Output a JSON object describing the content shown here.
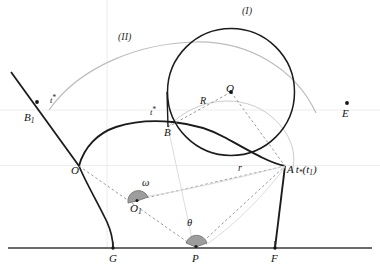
{
  "figure": {
    "type": "geometry-diagram"
  },
  "colors": {
    "stroke_dark": "#1b1b1b",
    "stroke_gray": "#8e8e8e",
    "stroke_light": "#c9c9c9",
    "guide_line": "#e6e6e6",
    "angle_fill": "#9d9d9d",
    "baseline": "#3a3a3a",
    "label": "#141414"
  },
  "curve_labels": [
    {
      "name": "curve-label-one",
      "text": "(I)",
      "x": 244,
      "y": 8
    },
    {
      "name": "curve-label-two",
      "text": "(II)",
      "x": 120,
      "y": 34
    }
  ],
  "points": [
    {
      "name": "point-B1",
      "label": "B",
      "sub": "1",
      "x": 20,
      "y": 112
    },
    {
      "name": "point-O",
      "label": "O",
      "sub": "",
      "x": 79,
      "y": 166
    },
    {
      "name": "point-B",
      "label": "B",
      "sub": "",
      "x": 168,
      "y": 127
    },
    {
      "name": "point-A",
      "label": "A",
      "sub": "",
      "x": 285,
      "y": 166
    },
    {
      "name": "point-Q",
      "label": "Q",
      "sub": "",
      "x": 231,
      "y": 92
    },
    {
      "name": "point-E",
      "label": "E",
      "sub": "",
      "x": 344,
      "y": 112
    },
    {
      "name": "point-O1",
      "label": "O",
      "sub": "1",
      "x": 137,
      "y": 200
    },
    {
      "name": "point-G",
      "label": "G",
      "sub": "",
      "x": 113,
      "y": 255
    },
    {
      "name": "point-P",
      "label": "P",
      "sub": "",
      "x": 196,
      "y": 255
    },
    {
      "name": "point-F",
      "label": "F",
      "sub": "",
      "x": 275,
      "y": 255
    }
  ],
  "tangent_labels": [
    {
      "name": "tangent-label-B1",
      "text": "t",
      "star": "*",
      "x": 46,
      "y": 99
    },
    {
      "name": "tangent-label-B",
      "text": "t",
      "star": "*",
      "x": 152,
      "y": 112
    }
  ],
  "segment_labels": [
    {
      "name": "radius-label-R",
      "text": "R",
      "x": 203,
      "y": 101
    },
    {
      "name": "radius-label-r",
      "text": "r",
      "x": 240,
      "y": 168
    }
  ],
  "angle_labels": [
    {
      "name": "angle-label-omega",
      "text": "ω",
      "x": 145,
      "y": 183
    },
    {
      "name": "angle-label-theta",
      "text": "θ",
      "x": 190,
      "y": 223
    }
  ],
  "point_A_annotation": {
    "name": "point-A-parameter-label",
    "main": "A",
    "param": "t",
    "param_sub": "*",
    "paren_open": "(",
    "arg": "t",
    "arg_sub": "1",
    "paren_close": ")",
    "x": 285,
    "y": 166
  },
  "geometry": {
    "baseline_y": 248,
    "guide_lines_horizontal_y": [
      110,
      165
    ],
    "guide_lines_vertical_x": [
      107
    ]
  }
}
